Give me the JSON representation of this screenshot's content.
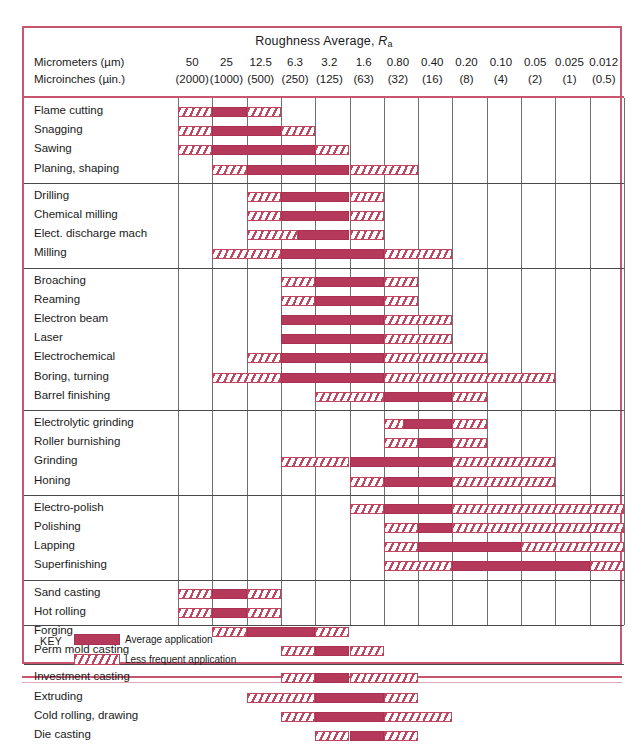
{
  "chart_data": {
    "type": "table",
    "title_text": "Roughness Average, ",
    "title_symbol": "R",
    "title_sub": "a",
    "units": [
      {
        "label": "Micrometers (µm)",
        "values": [
          "50",
          "25",
          "12.5",
          "6.3",
          "3.2",
          "1.6",
          "0.80",
          "0.40",
          "0.20",
          "0.10",
          "0.05",
          "0.025",
          "0.012"
        ]
      },
      {
        "label": "Microinches (µin.)",
        "values": [
          "(2000)",
          "(1000)",
          "(500)",
          "(250)",
          "(125)",
          "(63)",
          "(32)",
          "(16)",
          "(8)",
          "(4)",
          "(2)",
          "(1)",
          "(0.5)"
        ]
      }
    ],
    "groups": [
      {
        "name": "rough-machining",
        "rows": [
          {
            "label": "Flame cutting",
            "less": [
              [
                0,
                1
              ],
              [
                2,
                3
              ]
            ],
            "avg": [
              [
                1,
                2
              ]
            ]
          },
          {
            "label": "Snagging",
            "less": [
              [
                0,
                1
              ],
              [
                3,
                4
              ]
            ],
            "avg": [
              [
                1,
                3
              ]
            ]
          },
          {
            "label": "Sawing",
            "less": [
              [
                0,
                1
              ],
              [
                4,
                5
              ]
            ],
            "avg": [
              [
                1,
                4
              ]
            ]
          },
          {
            "label": "Planing, shaping",
            "less": [
              [
                1,
                2
              ],
              [
                5,
                7
              ]
            ],
            "avg": [
              [
                2,
                5
              ]
            ]
          }
        ]
      },
      {
        "name": "machining",
        "rows": [
          {
            "label": "Drilling",
            "less": [
              [
                2,
                3
              ],
              [
                5,
                6
              ]
            ],
            "avg": [
              [
                3,
                5
              ]
            ]
          },
          {
            "label": "Chemical milling",
            "less": [
              [
                2,
                3
              ],
              [
                5,
                6
              ]
            ],
            "avg": [
              [
                3,
                5
              ]
            ]
          },
          {
            "label": "Elect. discharge mach",
            "less": [
              [
                2,
                3.5
              ],
              [
                5,
                6
              ]
            ],
            "avg": [
              [
                3.5,
                5
              ]
            ]
          },
          {
            "label": "Milling",
            "less": [
              [
                1,
                3
              ],
              [
                6,
                8
              ]
            ],
            "avg": [
              [
                3,
                6
              ]
            ]
          }
        ]
      },
      {
        "name": "precision-machining",
        "rows": [
          {
            "label": "Broaching",
            "less": [
              [
                3,
                4
              ],
              [
                6,
                7
              ]
            ],
            "avg": [
              [
                4,
                6
              ]
            ]
          },
          {
            "label": "Reaming",
            "less": [
              [
                3,
                4
              ],
              [
                6,
                7
              ]
            ],
            "avg": [
              [
                4,
                6
              ]
            ]
          },
          {
            "label": "Electron beam",
            "less": [
              [
                6,
                8
              ]
            ],
            "avg": [
              [
                3,
                6
              ]
            ]
          },
          {
            "label": "Laser",
            "less": [
              [
                6,
                8
              ]
            ],
            "avg": [
              [
                3,
                6
              ]
            ]
          },
          {
            "label": "Electrochemical",
            "less": [
              [
                2,
                3
              ],
              [
                6,
                9
              ]
            ],
            "avg": [
              [
                3,
                6
              ]
            ]
          },
          {
            "label": "Boring, turning",
            "less": [
              [
                1,
                3
              ],
              [
                6,
                11
              ]
            ],
            "avg": [
              [
                3,
                6
              ]
            ]
          },
          {
            "label": "Barrel finishing",
            "less": [
              [
                4,
                6
              ],
              [
                8,
                9
              ]
            ],
            "avg": [
              [
                6,
                8
              ]
            ]
          }
        ]
      },
      {
        "name": "abrasive",
        "rows": [
          {
            "label": "Electrolytic grinding",
            "less": [
              [
                6,
                6.6
              ],
              [
                8,
                9
              ]
            ],
            "avg": [
              [
                6.6,
                8
              ]
            ]
          },
          {
            "label": "Roller burnishing",
            "less": [
              [
                6,
                7
              ],
              [
                8,
                9
              ]
            ],
            "avg": [
              [
                7,
                8
              ]
            ]
          },
          {
            "label": "Grinding",
            "less": [
              [
                3,
                5
              ],
              [
                8,
                11
              ]
            ],
            "avg": [
              [
                5,
                8
              ]
            ]
          },
          {
            "label": "Honing",
            "less": [
              [
                5,
                6
              ],
              [
                8,
                11
              ]
            ],
            "avg": [
              [
                6,
                8
              ]
            ]
          }
        ]
      },
      {
        "name": "superfinishing",
        "rows": [
          {
            "label": "Electro-polish",
            "less": [
              [
                5,
                6
              ],
              [
                8,
                13
              ]
            ],
            "avg": [
              [
                6,
                8
              ]
            ]
          },
          {
            "label": "Polishing",
            "less": [
              [
                6,
                7
              ],
              [
                8,
                13
              ]
            ],
            "avg": [
              [
                7,
                8
              ]
            ]
          },
          {
            "label": "Lapping",
            "less": [
              [
                6,
                7
              ],
              [
                10,
                13
              ]
            ],
            "avg": [
              [
                7,
                10
              ]
            ]
          },
          {
            "label": "Superfinishing",
            "less": [
              [
                6,
                8
              ],
              [
                12,
                13
              ]
            ],
            "avg": [
              [
                8,
                12
              ]
            ]
          }
        ]
      },
      {
        "name": "casting-forming",
        "rows": [
          {
            "label": "Sand casting",
            "less": [
              [
                0,
                1
              ],
              [
                2,
                3
              ]
            ],
            "avg": [
              [
                1,
                2
              ]
            ]
          },
          {
            "label": "Hot rolling",
            "less": [
              [
                0,
                1
              ],
              [
                2,
                3
              ]
            ],
            "avg": [
              [
                1,
                2
              ]
            ]
          },
          {
            "label": "Forging",
            "less": [
              [
                1,
                2
              ],
              [
                4,
                5
              ]
            ],
            "avg": [
              [
                2,
                4
              ]
            ]
          },
          {
            "label": "Perm mold casting",
            "less": [
              [
                3,
                4
              ],
              [
                5,
                6
              ]
            ],
            "avg": [
              [
                4,
                5
              ]
            ]
          }
        ]
      },
      {
        "name": "net-shape",
        "rows": [
          {
            "label": "Investment casting",
            "less": [
              [
                3,
                4
              ],
              [
                5,
                7
              ]
            ],
            "avg": [
              [
                4,
                5
              ]
            ]
          },
          {
            "label": "Extruding",
            "less": [
              [
                2,
                4
              ],
              [
                6,
                7
              ]
            ],
            "avg": [
              [
                4,
                6
              ]
            ]
          },
          {
            "label": "Cold rolling, drawing",
            "less": [
              [
                3,
                4
              ],
              [
                6,
                8
              ]
            ],
            "avg": [
              [
                4,
                6
              ]
            ]
          },
          {
            "label": "Die casting",
            "less": [
              [
                4,
                5
              ],
              [
                6,
                7
              ]
            ],
            "avg": [
              [
                5,
                6
              ]
            ]
          }
        ]
      }
    ],
    "key": {
      "word": "KEY",
      "entries": [
        {
          "swatch": "average",
          "label": "Average application"
        },
        {
          "swatch": "less",
          "label": "Less frequent application"
        }
      ]
    },
    "colors": {
      "bar": "#b5395a",
      "frame": "#c8566f",
      "grid": "#6e6e6e"
    }
  }
}
